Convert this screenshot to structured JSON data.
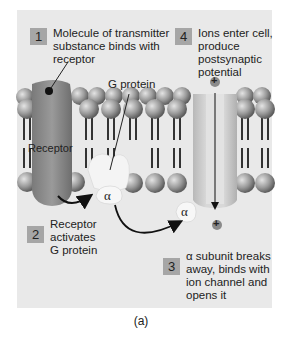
{
  "figure": {
    "caption": "(a)",
    "steps": [
      {
        "number": "1",
        "text_lines": [
          "Molecule of transmitter",
          "substance binds with",
          "receptor"
        ]
      },
      {
        "number": "2",
        "text_lines": [
          "Receptor",
          "activates",
          "G protein"
        ]
      },
      {
        "number": "3",
        "text_lines": [
          "α subunit breaks",
          "away, binds with",
          "ion channel and",
          "opens it"
        ]
      },
      {
        "number": "4",
        "text_lines": [
          "Ions enter cell,",
          "produce",
          "postsynaptic",
          "potential"
        ]
      }
    ],
    "labels": {
      "receptor": "Receptor",
      "g_protein": "G protein",
      "alpha_bound": "α",
      "alpha_free": "α",
      "ion_top": "+",
      "ion_bottom": "+"
    },
    "colors": {
      "panel_bg": "#e9e9e9",
      "number_box": "#a6a6a6",
      "receptor": "#8a8a8a",
      "lipid_head": "#9a9a9a",
      "channel": "#cfcfcf",
      "g_protein": "#f4f4f4"
    }
  }
}
